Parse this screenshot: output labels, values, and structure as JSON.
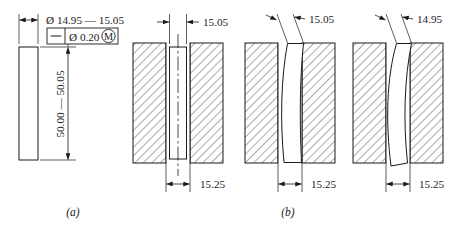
{
  "figure": {
    "type": "engineering-drawing",
    "captions": {
      "a": "(a)",
      "b": "(b)"
    }
  },
  "part_a": {
    "name": "pin-side-view",
    "diameter_dimension": "Ø 14.95 — 15.05",
    "length_dimension": "50.00 — 50.05",
    "feature_control_frame": {
      "characteristic_symbol": "straightness",
      "characteristic_glyph": "—",
      "diameter_symbol": "Ø",
      "tolerance_value": "0.20",
      "material_condition": "M",
      "material_condition_full": "Ø 0.20 Ⓜ",
      "tolerance_text": "Ø 0.20"
    }
  },
  "part_b": {
    "name": "virtual-condition-boundary-sections",
    "sections": [
      {
        "id": "section-1",
        "label": "perfectly-straight-pin-at-mmc",
        "top_dimension": "15.05",
        "bottom_dimension": "15.25",
        "deformation": "none"
      },
      {
        "id": "section-2",
        "label": "bowed-pin-at-mmc",
        "top_dimension": "15.05",
        "bottom_dimension": "15.25",
        "deformation": "slight-bow"
      },
      {
        "id": "section-3",
        "label": "bowed-pin-at-lmc",
        "top_dimension": "14.95",
        "bottom_dimension": "15.25",
        "deformation": "large-bow"
      }
    ]
  },
  "colors": {
    "line": "#1a1a1a",
    "hatch": "#555555",
    "background": "#ffffff",
    "text": "#1a1a1a"
  }
}
